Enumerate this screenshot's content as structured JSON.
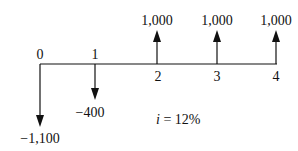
{
  "diagram": {
    "type": "cash-flow-diagram",
    "interest_label": "i = 12%",
    "interest_var": "i",
    "interest_rest": " = 12%",
    "periods": [
      {
        "label": "0",
        "cash_flow": "−1,100",
        "value": -1100,
        "x": 40
      },
      {
        "label": "1",
        "cash_flow": "−400",
        "value": -400,
        "x": 95
      },
      {
        "label": "2",
        "cash_flow": "1,000",
        "value": 1000,
        "x": 157
      },
      {
        "label": "3",
        "cash_flow": "1,000",
        "value": 1000,
        "x": 217
      },
      {
        "label": "4",
        "cash_flow": "1,000",
        "value": 1000,
        "x": 276
      }
    ]
  }
}
